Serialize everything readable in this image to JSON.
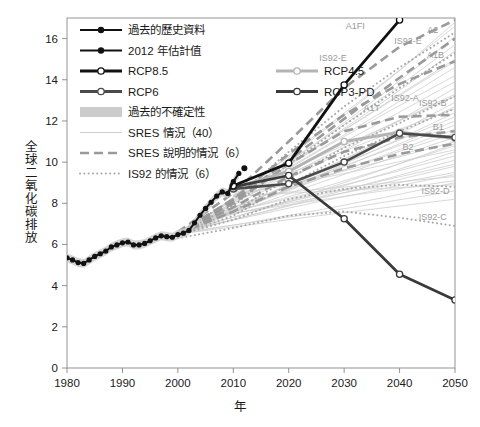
{
  "chart_data": {
    "type": "line",
    "title": "",
    "xlabel": "年",
    "ylabel": "全球二氧化碳排放",
    "xlim": [
      1980,
      2050
    ],
    "ylim": [
      0,
      17
    ],
    "xticks": [
      "1980",
      "1990",
      "2000",
      "2010",
      "2020",
      "2030",
      "2040",
      "2050"
    ],
    "yticks": [
      "0",
      "2",
      "4",
      "6",
      "8",
      "10",
      "12",
      "14",
      "16"
    ],
    "grid": false,
    "legend_position": "upper-left-inside",
    "series": [
      {
        "name": "過去的歷史資料",
        "style": "solid-marker-black",
        "color": "#111111",
        "x": [
          1980,
          1981,
          1982,
          1983,
          1984,
          1985,
          1986,
          1987,
          1988,
          1989,
          1990,
          1991,
          1992,
          1993,
          1994,
          1995,
          1996,
          1997,
          1998,
          1999,
          2000,
          2001,
          2002,
          2003,
          2004,
          2005,
          2006,
          2007,
          2008,
          2009,
          2010,
          2011
        ],
        "values": [
          5.35,
          5.25,
          5.12,
          5.08,
          5.25,
          5.42,
          5.55,
          5.68,
          5.88,
          5.98,
          6.08,
          6.12,
          5.98,
          5.98,
          6.05,
          6.18,
          6.32,
          6.42,
          6.38,
          6.35,
          6.48,
          6.55,
          6.68,
          7.05,
          7.42,
          7.75,
          8.05,
          8.35,
          8.55,
          8.48,
          9.05,
          9.45
        ]
      },
      {
        "name": "2012 年估計值",
        "style": "solid-marker-black-filled",
        "color": "#111111",
        "x": [
          2012
        ],
        "values": [
          9.7
        ]
      },
      {
        "name": "RCP8.5",
        "style": "solid-marker-open",
        "color": "#111111",
        "x": [
          2010,
          2020,
          2030,
          2040
        ],
        "values": [
          8.85,
          9.95,
          13.75,
          16.9
        ]
      },
      {
        "name": "RCP6",
        "style": "solid-marker-open",
        "color": "#4a4a4a",
        "x": [
          2010,
          2020,
          2030,
          2040,
          2050
        ],
        "values": [
          8.7,
          8.95,
          10.0,
          11.4,
          11.2
        ]
      },
      {
        "name": "RCP4.5",
        "style": "solid-marker-open-light",
        "color": "#b4b4b4",
        "x": [
          2010,
          2020,
          2030,
          2040,
          2050
        ],
        "values": [
          8.75,
          9.55,
          11.0,
          11.45,
          11.15
        ]
      },
      {
        "name": "RCP3-PD",
        "style": "solid-marker-open-dark",
        "color": "#3a3a3a",
        "x": [
          2010,
          2020,
          2030,
          2040,
          2050
        ],
        "values": [
          8.8,
          9.35,
          7.25,
          4.55,
          3.3
        ]
      }
    ],
    "annotations": [
      {
        "label": "A1FI",
        "x": 2032.0,
        "y": 16.45
      },
      {
        "label": "A2",
        "x": 2046.0,
        "y": 16.25
      },
      {
        "label": "IS92-E",
        "x": 2041.5,
        "y": 15.75
      },
      {
        "label": "A1B",
        "x": 2046.5,
        "y": 15.05
      },
      {
        "label": "IS92-E",
        "x": 2028.0,
        "y": 14.9
      },
      {
        "label": "IS92-A",
        "x": 2041.0,
        "y": 12.95
      },
      {
        "label": "IS92-B",
        "x": 2046.0,
        "y": 12.75
      },
      {
        "label": "A1T",
        "x": 2035.0,
        "y": 12.5
      },
      {
        "label": "B1",
        "x": 2047.0,
        "y": 11.55
      },
      {
        "label": "B2",
        "x": 2041.5,
        "y": 10.6
      },
      {
        "label": "IS92-D",
        "x": 2046.5,
        "y": 8.45
      },
      {
        "label": "IS92-C",
        "x": 2046.0,
        "y": 7.2
      }
    ],
    "uncertainty_band_label": "過去的不確定性"
  },
  "legend": {
    "items": [
      {
        "label": "過去的歷史資料",
        "key": "historical",
        "swatch": "line-marker-black"
      },
      {
        "label": "2012 年估計值",
        "key": "estimate-2012",
        "swatch": "line-marker-black-filled"
      },
      {
        "label": "RCP8.5",
        "key": "rcp85",
        "swatch": "line-marker-open-black"
      },
      {
        "label": "RCP4.5",
        "key": "rcp45",
        "swatch": "line-marker-open-light"
      },
      {
        "label": "RCP6",
        "key": "rcp6",
        "swatch": "line-marker-open-gray"
      },
      {
        "label": "RCP3-PD",
        "key": "rcp3pd",
        "swatch": "line-marker-open-dark"
      },
      {
        "label": "過去的不確定性",
        "key": "uncertainty",
        "swatch": "band"
      },
      {
        "label": "SRES 情況（40）",
        "key": "sres40",
        "swatch": "thin-line"
      },
      {
        "label": "SRES 說明的情況（6）",
        "key": "sres6",
        "swatch": "dashed-line"
      },
      {
        "label": "IS92 的情況（6）",
        "key": "is92",
        "swatch": "dotted-line"
      }
    ]
  },
  "colors": {
    "historical": "#111111",
    "rcp85": "#111111",
    "rcp6": "#4a4a4a",
    "rcp45": "#b4b4b4",
    "rcp3pd": "#3a3a3a",
    "sres_thin": "#cfcfcf",
    "sres_dashed": "#9a9a9a",
    "is92_dotted": "#a8a8a8",
    "band": "#cccccc",
    "axis": "#888888",
    "text": "#1a1a1a",
    "annotation": "#9a9a9a"
  }
}
